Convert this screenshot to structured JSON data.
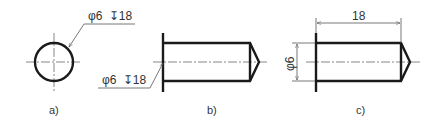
{
  "figures": [
    {
      "id": "a",
      "label": "a)",
      "view": "end view (circle)",
      "annotation": {
        "diameter_symbol": "φ",
        "diameter": "6",
        "depth_symbol": "↧",
        "depth": "18"
      }
    },
    {
      "id": "b",
      "label": "b)",
      "view": "side view with leader annotation",
      "annotation": {
        "diameter_symbol": "φ",
        "diameter": "6",
        "depth_symbol": "↧",
        "depth": "18"
      }
    },
    {
      "id": "c",
      "label": "c)",
      "view": "side view with dimensions",
      "dimensions": {
        "length": "18",
        "diameter_text": "φ6"
      }
    }
  ],
  "colors": {
    "line": "#1a1a1a",
    "thin_line": "#555555",
    "text": "#333333",
    "background": "#ffffff"
  }
}
